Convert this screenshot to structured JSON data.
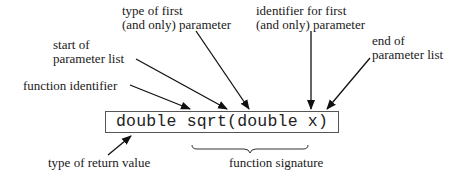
{
  "diagram": {
    "code": "double sqrt(double x)",
    "labels": {
      "type_first_param": [
        "type of first",
        "(and only) parameter"
      ],
      "identifier_first_param": [
        "identifier for first",
        "(and only) parameter"
      ],
      "start_param_list": [
        "start of",
        "parameter list"
      ],
      "end_param_list": [
        "end of",
        "parameter list"
      ],
      "function_identifier": "function identifier",
      "return_type": "type of return value",
      "function_signature": "function signature"
    }
  }
}
